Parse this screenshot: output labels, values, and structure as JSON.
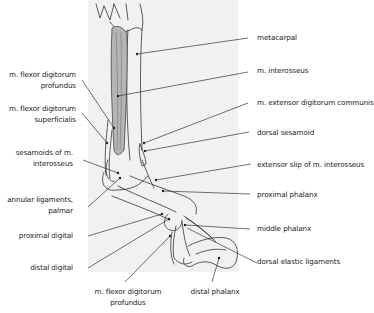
{
  "diagram": {
    "background_panel_color": "#f1f1f1",
    "muscle_fill_color": "#b5b5b5",
    "line_color": "#333333"
  },
  "labels_left": [
    {
      "line1": "m. flexor digitorum",
      "line2": "profundus"
    },
    {
      "line1": "m. flexor digitorum",
      "line2": "superficialis"
    },
    {
      "line1": "sesamoids of m.",
      "line2": "interosseus"
    },
    {
      "line1": "annular ligaments,",
      "line2": "palmar"
    },
    {
      "line1": "proximal digital"
    },
    {
      "line1": "distal digital"
    }
  ],
  "labels_right": [
    {
      "text": "metacarpal"
    },
    {
      "text": "m. interosseus"
    },
    {
      "text": "m. extensor digitorum communis"
    },
    {
      "text": "dorsal sesamoid"
    },
    {
      "text": "extensor slip of m. interosseus"
    },
    {
      "text": "proximal phalanx"
    },
    {
      "text": "middle phalanx"
    },
    {
      "text": "dorsal elastic ligaments"
    }
  ],
  "labels_bottom": [
    {
      "line1": "m. flexor digitorum",
      "line2": "profundus"
    },
    {
      "text": "distal phalanx"
    }
  ]
}
